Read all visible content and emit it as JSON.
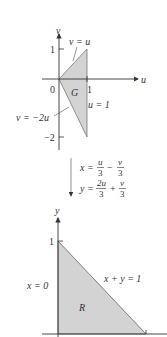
{
  "top_diagram": {
    "region_label": "G",
    "axis_u_label": "u",
    "axis_v_label": "v",
    "origin_label": "0",
    "tick_u_1": "1",
    "tick_v_1": "1",
    "tick_v_neg2": "−2",
    "line_upper_label": "v = u",
    "line_lower_label": "v = −2u",
    "line_right_label": "u = 1",
    "vertices": [
      [
        0,
        0
      ],
      [
        1,
        1
      ],
      [
        1,
        -2
      ]
    ]
  },
  "transform": {
    "x_lhs": "x =",
    "x_t1_num": "u",
    "x_t1_den": "3",
    "x_op": "−",
    "x_t2_num": "v",
    "x_t2_den": "3",
    "y_lhs": "y =",
    "y_t1_num": "2u",
    "y_t1_den": "3",
    "y_op": "+",
    "y_t2_num": "v",
    "y_t2_den": "3"
  },
  "bottom_diagram": {
    "region_label": "R",
    "axis_y_label": "y",
    "tick_y_1": "1",
    "line_left_label": "x = 0",
    "line_hyp_label": "x + y = 1",
    "vertices": [
      [
        0,
        0
      ],
      [
        0,
        1
      ],
      [
        1,
        0
      ]
    ]
  },
  "colors": {
    "fill": "#d3d3d3",
    "stroke": "#555555",
    "axis": "#333333"
  }
}
